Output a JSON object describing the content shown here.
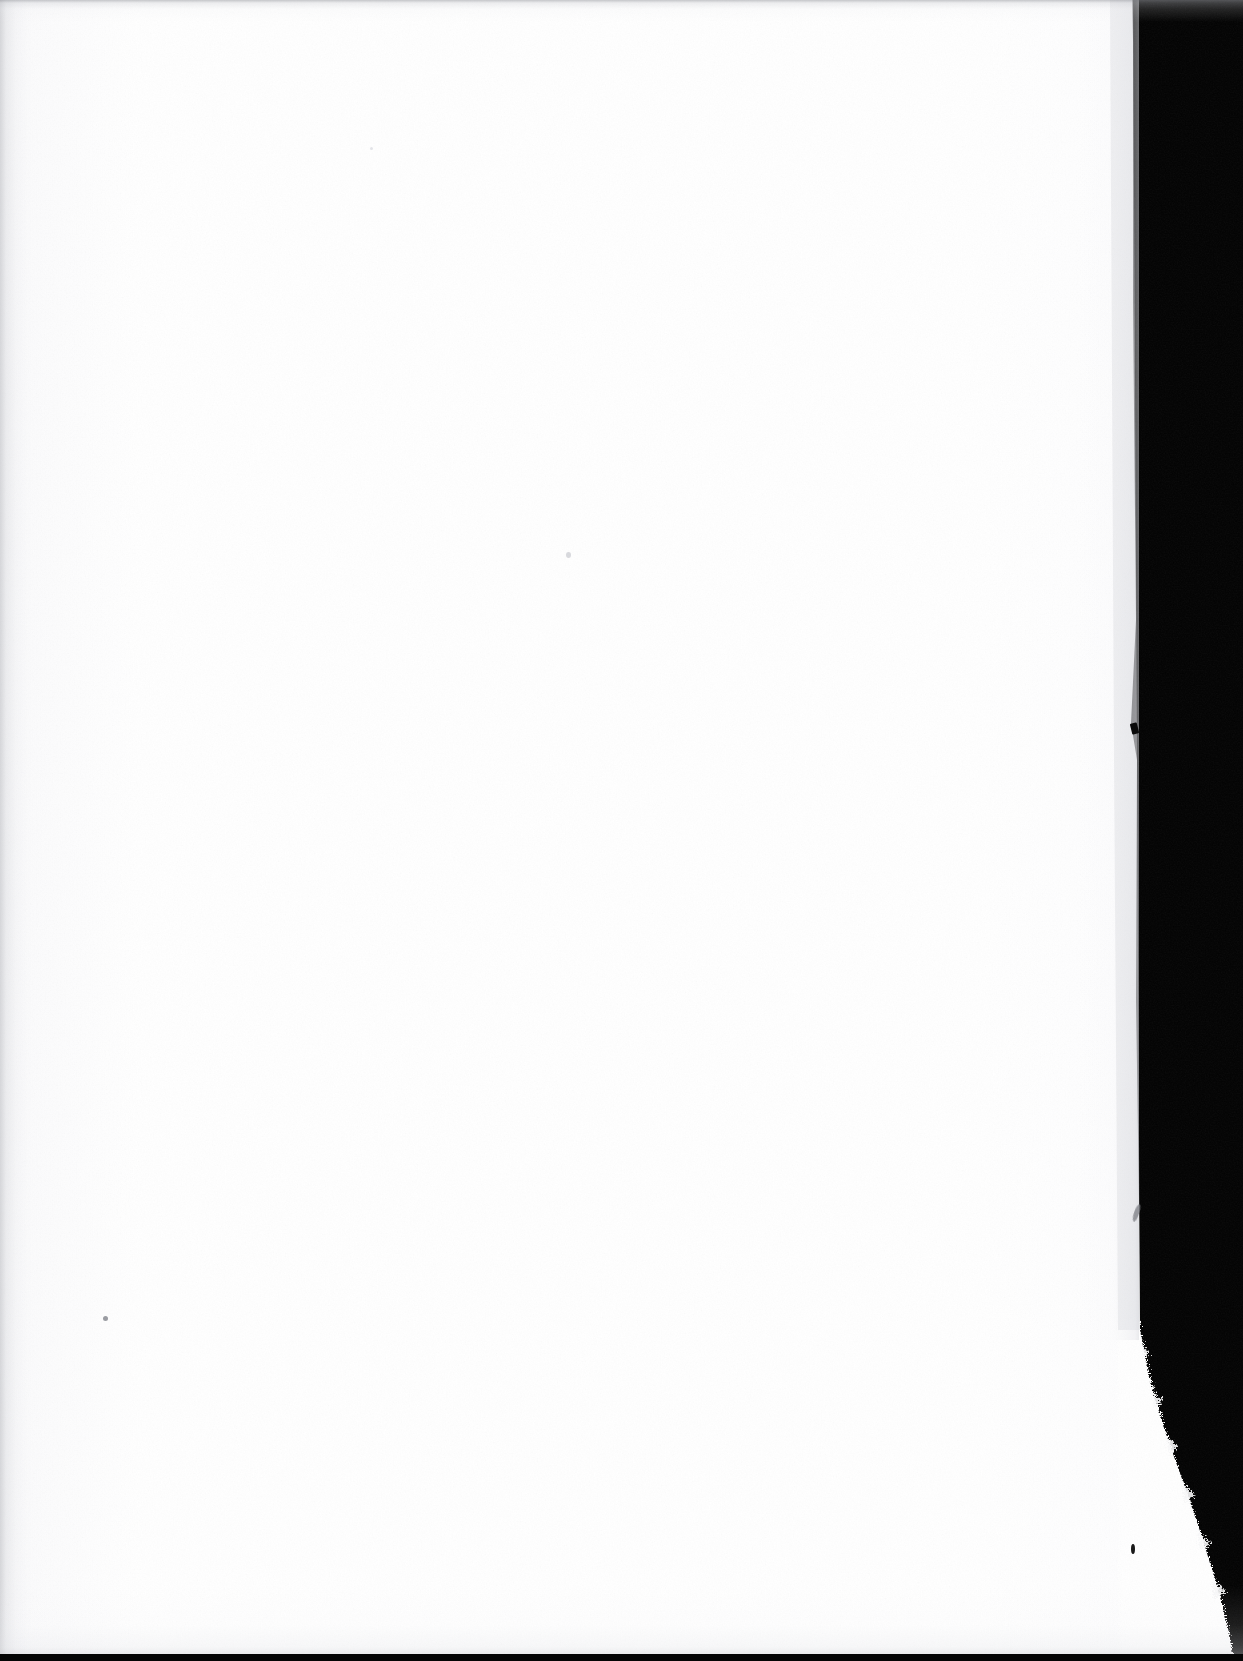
{
  "document": {
    "kind": "scanned-page",
    "description": "Blank scanned leaf (flyleaf / endpaper) on black scanner background",
    "visible_text": "",
    "page_number_text": "",
    "caption_text": ""
  },
  "canvas": {
    "width": 1243,
    "height": 1661
  },
  "colors": {
    "scanner_background": "#020202",
    "paper_white": "#ffffff",
    "paper_shadow_edge": "#c9cbd0",
    "paper_grain": "#f3f3f5",
    "bottom_strip": "#050505"
  },
  "page_geometry": {
    "note": "Right edge of the paper: near-vertical down to y~1330, then a torn deckled diagonal flaring out to the bottom-right corner.",
    "left_edge_x": 0,
    "top_edge_y": 0,
    "right_edge_top_x": 1133,
    "right_edge_mid_x": 1138,
    "right_edge_tear_start_y": 1330,
    "right_edge_bottom_x": 1232,
    "bottom_edge_y": 1654
  },
  "defects": [
    {
      "name": "edge-notch",
      "x": 1131,
      "y": 723,
      "w": 7,
      "h": 11,
      "color": "#0a0a0a",
      "shape": "wedge"
    },
    {
      "name": "edge-fiber",
      "x": 1134,
      "y": 1204,
      "w": 5,
      "h": 18,
      "color": "#7b7d83",
      "shape": "wisp"
    },
    {
      "name": "paper-speck-center",
      "x": 566,
      "y": 552,
      "w": 5,
      "h": 6,
      "color": "#d8d9dd",
      "shape": "dot"
    },
    {
      "name": "paper-speck-lower-left",
      "x": 103,
      "y": 1316,
      "w": 5,
      "h": 5,
      "color": "#9a9ca2",
      "shape": "dot"
    },
    {
      "name": "paper-speck-tear",
      "x": 1131,
      "y": 1544,
      "w": 4,
      "h": 10,
      "color": "#1a1a1a",
      "shape": "dot"
    },
    {
      "name": "paper-speck-upper",
      "x": 370,
      "y": 147,
      "w": 3,
      "h": 3,
      "color": "#e3e4e8",
      "shape": "dot"
    }
  ],
  "labels": {
    "scanner_void": "scanner background",
    "page": "blank page",
    "bottom_strip": "scanner bed edge"
  }
}
